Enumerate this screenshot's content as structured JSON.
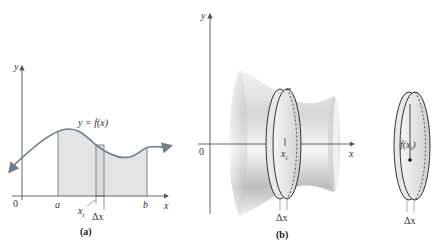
{
  "panel_a": {
    "caption": "(a)",
    "y_axis_label": "y",
    "x_axis_label": "x",
    "origin_label": "0",
    "curve_label": "y = f(x)",
    "left_bound_label": "a",
    "right_bound_label": "b",
    "sample_point_label": "x",
    "sample_point_subscript": "i",
    "width_label": "Δx",
    "colors": {
      "curve": "#6f7f8c",
      "fill": "#e4e4e4",
      "axes": "#555555"
    }
  },
  "panel_b": {
    "caption": "(b)",
    "y_axis_label": "y",
    "x_axis_label": "x",
    "origin_label": "0",
    "sample_point_label": "x",
    "sample_point_subscript": "i",
    "width_label": "Δx"
  },
  "panel_c": {
    "radius_label": "f(x",
    "radius_subscript": "i",
    "radius_label_close": ")",
    "width_label": "Δx"
  }
}
